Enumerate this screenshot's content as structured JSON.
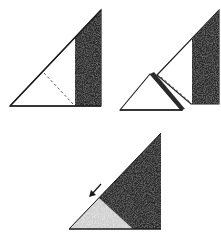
{
  "diagram": {
    "colors": {
      "background": "#ffffff",
      "outline": "#1a1a1a",
      "dark_fill": "#2b2b2b",
      "light_fill": "#cfcfcf",
      "paper_fill": "#ffffff",
      "dashed_line": "#555555"
    },
    "steps": [
      {
        "id": "step-1",
        "label": "",
        "note": "Triangle with dark vertical strip on the right and dashed fold line"
      },
      {
        "id": "step-2",
        "label": "",
        "note": "Lower-left corner separated / folded along the dashed line"
      },
      {
        "id": "step-3",
        "label": "",
        "note": "Folded result with light-gray triangle and arrow pointing down-left"
      }
    ]
  }
}
